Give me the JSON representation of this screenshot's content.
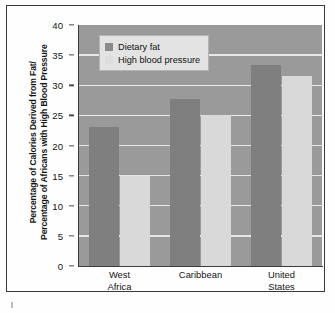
{
  "chart_data": {
    "type": "bar",
    "title": "",
    "subtitle": "",
    "xlabel": "",
    "ylabel": "Percentage of Calories Derived from Fat/ Percentage of Africans with High Blood Pressure",
    "ylabel_line1": "Percentage of Calories Derived from Fat/",
    "ylabel_line2": "Percentage of Africans with High Blood Pressure",
    "categories": [
      "West Africa",
      "Caribbean",
      "United States"
    ],
    "category_lines": [
      [
        "West",
        "Africa"
      ],
      [
        "Caribbean",
        ""
      ],
      [
        "United",
        "States"
      ]
    ],
    "series": [
      {
        "name": "Dietary fat",
        "values": [
          23,
          27.8,
          33.3
        ],
        "color": "#7f7f7f"
      },
      {
        "name": "High blood pressure",
        "values": [
          15,
          25,
          31.5
        ],
        "color": "#d9d9d9"
      }
    ],
    "ylim": [
      0,
      40
    ],
    "ytick_values": [
      0,
      5,
      10,
      15,
      20,
      25,
      30,
      35,
      40
    ],
    "ytick_labels": [
      "0",
      "5",
      "10",
      "15",
      "20",
      "25",
      "30",
      "35",
      "40"
    ],
    "grid": true,
    "grid_axis": "y",
    "legend_position": "top-left-inside",
    "plot_background": "#9a9a9a",
    "gridline_color": "#e8e8e8",
    "frame_color": "#3a3a3a"
  },
  "legend": {
    "items": [
      {
        "label": "Dietary fat",
        "swatch": "dark"
      },
      {
        "label": "High blood pressure",
        "swatch": "light"
      }
    ]
  }
}
